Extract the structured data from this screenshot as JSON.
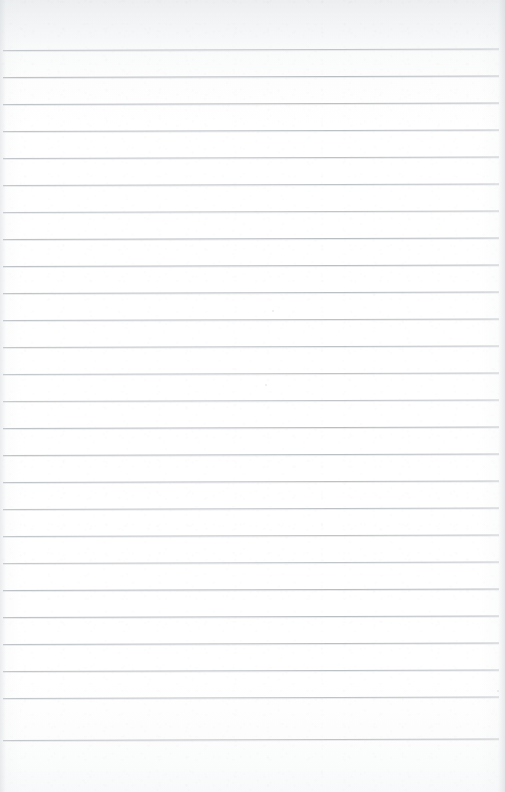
{
  "document": {
    "kind": "ruled-notebook-paper",
    "title": "Blank lined paper sheet",
    "text_content": "",
    "written_text_present": "no",
    "page_width_px": 505,
    "page_height_px": 792
  },
  "paper": {
    "background_color": "#ffffff",
    "top_shade_color": "#eceef0",
    "bottom_shade_color": "#f8f9fa",
    "left_edge_shade_color": "#d2d6da",
    "right_edge_shade_color": "#d0d4d9",
    "texture": "subtle-grain"
  },
  "ruling": {
    "line_color": "#b5babf",
    "line_thickness_px": 1,
    "line_spacing_px": 27,
    "first_line_y_px": 50,
    "line_count": 26,
    "line_start_x_px": 3,
    "line_end_x_px": 499,
    "tilt_degrees": -0.18,
    "top_margin_px": 50,
    "bottom_margin_px": 50,
    "left_margin_rule": "none",
    "lines_y_px": [
      50,
      77,
      104,
      131,
      158,
      185,
      212,
      239,
      266,
      293,
      320,
      347,
      374,
      401,
      428,
      455,
      482,
      509,
      536,
      563,
      590,
      617,
      644,
      671,
      698,
      740
    ]
  },
  "marks": [
    {
      "name": "faint-line-break",
      "x_px": 150,
      "y_px": 326,
      "width_px": 48,
      "height_px": 5
    },
    {
      "name": "paper-speck-a",
      "x_px": 272,
      "y_px": 310,
      "size_px": 2
    },
    {
      "name": "paper-speck-b",
      "x_px": 265,
      "y_px": 384,
      "size_px": 2
    },
    {
      "name": "paper-speck-c",
      "x_px": 497,
      "y_px": 690,
      "size_px": 2
    }
  ]
}
